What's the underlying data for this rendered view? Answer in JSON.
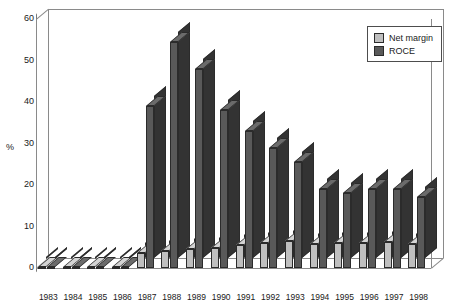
{
  "chart_data": {
    "type": "bar",
    "title": "",
    "subtitle": "",
    "xlabel": "",
    "ylabel": "%",
    "ylim": [
      0,
      60
    ],
    "yticks": [
      0,
      10,
      20,
      30,
      40,
      50,
      60
    ],
    "grid": false,
    "legend_position": "top-right",
    "style": "3d-clustered-column",
    "categories": [
      "1983",
      "1984",
      "1985",
      "1986",
      "1987",
      "1988",
      "1989",
      "1990",
      "1991",
      "1992",
      "1993",
      "1994",
      "1995",
      "1996",
      "1997",
      "1998"
    ],
    "series": [
      {
        "name": "Net margin",
        "color": "#bfbfbf",
        "values": [
          0,
          0,
          0,
          0,
          3.5,
          4.2,
          4.5,
          4.8,
          5.5,
          6.0,
          6.5,
          5.8,
          6.0,
          6.0,
          6.2,
          5.8
        ]
      },
      {
        "name": "ROCE",
        "color": "#595959",
        "values": [
          0,
          0,
          0,
          0,
          39,
          54.5,
          48,
          38,
          33,
          29,
          25.5,
          19,
          18,
          19,
          19,
          17
        ]
      }
    ]
  },
  "legend": {
    "items": [
      {
        "label": "Net margin",
        "color": "#bfbfbf"
      },
      {
        "label": "ROCE",
        "color": "#595959"
      }
    ]
  },
  "axes": {
    "y_unit": "%",
    "y_tick_labels": [
      "60",
      "50",
      "40",
      "30",
      "20",
      "10",
      "0"
    ],
    "x_tick_labels": [
      "1983",
      "1984",
      "1985",
      "1986",
      "1987",
      "1988",
      "1989",
      "1990",
      "1991",
      "1992",
      "1993",
      "1994",
      "1995",
      "1996",
      "1997",
      "1998"
    ]
  }
}
